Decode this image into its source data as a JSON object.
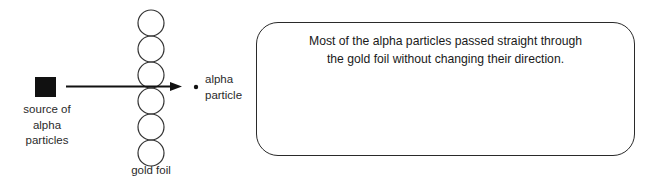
{
  "diagram": {
    "source": {
      "label_lines": [
        "source of",
        "alpha",
        "particles"
      ],
      "icon": "filled-square"
    },
    "gold_foil": {
      "label": "gold foil",
      "atom_count": 6
    },
    "particle": {
      "label_lines": [
        "alpha",
        "particle"
      ],
      "icon": "dot"
    },
    "path": {
      "type": "straight-arrow",
      "direction": "right"
    },
    "observation_box": {
      "text_lines": [
        "Most of the alpha particles passed straight through",
        "the gold foil without changing their direction."
      ]
    },
    "colors": {
      "stroke": "#2a2a2a",
      "fill": "#111111",
      "background": "#ffffff"
    }
  }
}
